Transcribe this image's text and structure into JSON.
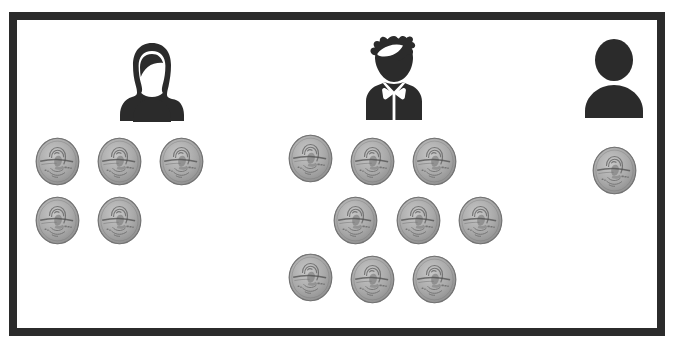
{
  "scene": {
    "title": "Three people with groups of pennies",
    "background_color": "#ffffff",
    "frame_color": "#2b2b2b",
    "frame_thickness_px": 8,
    "coin_type": "penny",
    "coin_face_color": "#a9a9a9",
    "coin_edge_color": "#6e6e6e"
  },
  "people": [
    {
      "id": "person-1",
      "label": "girl-with-ponytail",
      "icon": "person-female-icon",
      "x": 119,
      "y": 42,
      "width": 66,
      "height": 80,
      "coin_count": 5
    },
    {
      "id": "person-2",
      "label": "boy-with-bow-tie",
      "icon": "person-boy-icon",
      "x": 358,
      "y": 35,
      "width": 72,
      "height": 86,
      "coin_count": 9
    },
    {
      "id": "person-3",
      "label": "generic-person",
      "icon": "person-generic-icon",
      "x": 581,
      "y": 38,
      "width": 66,
      "height": 80,
      "coin_count": 1
    }
  ],
  "coin_groups": [
    {
      "owner": "person-1",
      "count": 5,
      "coins": [
        {
          "x": 35,
          "y": 137
        },
        {
          "x": 97,
          "y": 137
        },
        {
          "x": 159,
          "y": 137
        },
        {
          "x": 35,
          "y": 196
        },
        {
          "x": 97,
          "y": 196
        }
      ]
    },
    {
      "owner": "person-2",
      "count": 9,
      "coins": [
        {
          "x": 288,
          "y": 134
        },
        {
          "x": 350,
          "y": 137
        },
        {
          "x": 412,
          "y": 137
        },
        {
          "x": 333,
          "y": 196
        },
        {
          "x": 396,
          "y": 196
        },
        {
          "x": 458,
          "y": 196
        },
        {
          "x": 288,
          "y": 253
        },
        {
          "x": 350,
          "y": 255
        },
        {
          "x": 412,
          "y": 255
        }
      ]
    },
    {
      "owner": "person-3",
      "count": 1,
      "coins": [
        {
          "x": 592,
          "y": 146
        }
      ]
    }
  ],
  "totals": {
    "people": 3,
    "coins": 15
  }
}
